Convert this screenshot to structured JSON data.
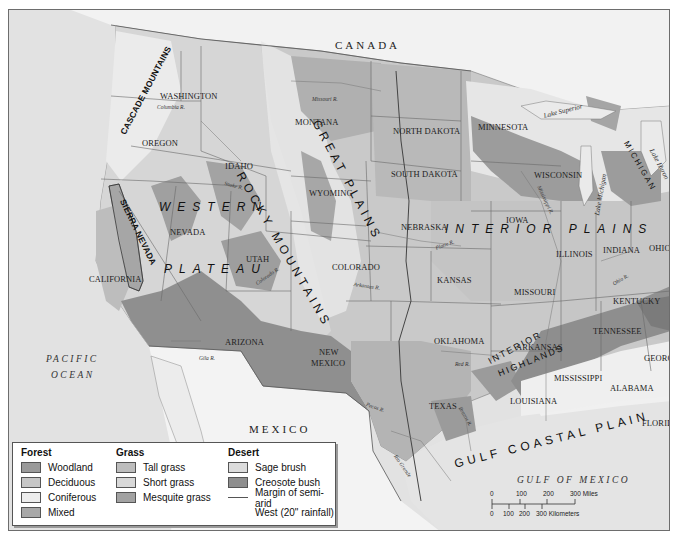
{
  "map": {
    "countries": {
      "canada": "CANADA",
      "mexico": "MEXICO"
    },
    "oceans": {
      "pacific_line1": "PACIFIC",
      "pacific_line2": "OCEAN",
      "gulf": "GULF OF MEXICO"
    },
    "regions": {
      "rocky_mountains": "ROCKY MOUNTAINS",
      "great_plains": "GREAT PLAINS",
      "western": "WESTERN",
      "plateau": "PLATEAU",
      "interior_plains": "INTERIOR PLAINS",
      "interior_highlands_1": "INTERIOR",
      "interior_highlands_2": "HIGHLANDS",
      "gulf_coastal_plain": "GULF COASTAL PLAIN",
      "cascade_mountains": "CASCADE MOUNTAINS",
      "sierra_nevada": "SIERRA NEVADA"
    },
    "states": {
      "washington": "WASHINGTON",
      "oregon": "OREGON",
      "idaho": "IDAHO",
      "montana": "MONTANA",
      "wyoming": "WYOMING",
      "nevada": "NEVADA",
      "utah": "UTAH",
      "colorado": "COLORADO",
      "california": "CALIFORNIA",
      "arizona": "ARIZONA",
      "new_mexico_1": "NEW",
      "new_mexico_2": "MEXICO",
      "north_dakota": "NORTH DAKOTA",
      "south_dakota": "SOUTH DAKOTA",
      "nebraska": "NEBRASKA",
      "kansas": "KANSAS",
      "oklahoma": "OKLAHOMA",
      "texas": "TEXAS",
      "minnesota": "MINNESOTA",
      "iowa": "IOWA",
      "missouri": "MISSOURI",
      "arkansas": "ARKANSAS",
      "louisiana": "LOUISIANA",
      "wisconsin": "WISCONSIN",
      "illinois": "ILLINOIS",
      "indiana": "INDIANA",
      "ohio": "OHIO",
      "kentucky": "KENTUCKY",
      "tennessee": "TENNESSEE",
      "mississippi": "MISSISSIPPI",
      "alabama": "ALABAMA",
      "georgia": "GEORGIA",
      "florida": "FLORIDA",
      "michigan": "MICHIGAN"
    },
    "rivers": {
      "missouri_r_mt": "Missouri R.",
      "columbia_r": "Columbia R.",
      "snake_r": "Snake R.",
      "colorado_r": "Colorado R.",
      "arkansas_r": "Arkansas R.",
      "platte_r": "Platte R.",
      "gila_r": "Gila R.",
      "red_r": "Red R.",
      "pecos_r": "Pecos R.",
      "brazos_r": "Brazos R.",
      "rio_grande": "Rio Grande",
      "ohio_r": "Ohio R.",
      "mississippi_r": "Mississippi R."
    },
    "lakes": {
      "superior": "Lake Superior",
      "michigan": "Lake Michigan",
      "huron": "Lake Huron"
    }
  },
  "legend": {
    "forest": {
      "title": "Forest",
      "items": [
        {
          "label": "Woodland",
          "color": "#9a9a9a"
        },
        {
          "label": "Deciduous",
          "color": "#c6c6c6"
        },
        {
          "label": "Coniferous",
          "color": "#ededed"
        },
        {
          "label": "Mixed",
          "color": "#a8a8a8"
        }
      ]
    },
    "grass": {
      "title": "Grass",
      "items": [
        {
          "label": "Tall grass",
          "color": "#bdbdbd"
        },
        {
          "label": "Short grass",
          "color": "#d8d8d8"
        },
        {
          "label": "Mesquite grass",
          "color": "#a2a2a2"
        }
      ]
    },
    "desert": {
      "title": "Desert",
      "items": [
        {
          "label": "Sage brush",
          "color": "#dcdcdc"
        },
        {
          "label": "Creosote bush",
          "color": "#8e8e8e"
        }
      ],
      "line_label_1": "Margin of semi-arid",
      "line_label_2": "West (20\" rainfall)"
    }
  },
  "scale_bar": {
    "miles": [
      "0",
      "100",
      "200",
      "300 Miles"
    ],
    "kilometers": [
      "0",
      "100",
      "200",
      "300 Kilometers"
    ]
  }
}
